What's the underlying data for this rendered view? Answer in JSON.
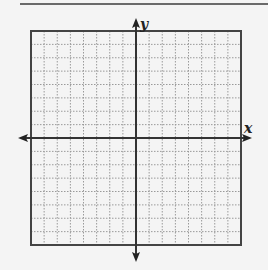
{
  "diagram": {
    "type": "coordinate-grid",
    "x_axis_label": "x",
    "y_axis_label": "y",
    "grid_cells_x": 16,
    "grid_cells_y": 16,
    "origin_cell": {
      "col": 8,
      "row": 8
    },
    "grid_line_style": "dotted",
    "colors": {
      "background": "#f4f4f4",
      "grid_line": "#9a9a9a",
      "border": "#444444",
      "axis": "#333333",
      "top_rule": "#6a6a6a"
    }
  }
}
